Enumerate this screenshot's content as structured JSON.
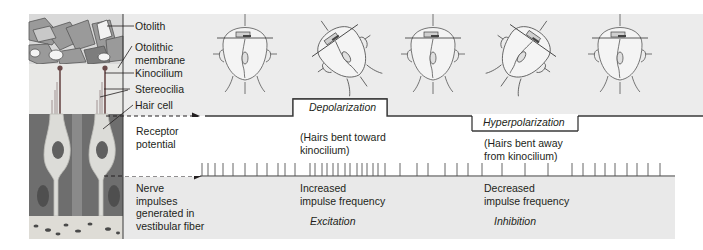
{
  "figure": {
    "colors": {
      "panel_bg": "#ececec",
      "line": "#3a3a3a",
      "tissue_dark": "#5a5a5a",
      "tissue_mid": "#8c8c8c",
      "cell_light": "#dcdcdc",
      "arrow": "#231f20"
    }
  },
  "anatomy_labels": {
    "otolith": "Otolith",
    "otolithic_membrane": "Otolithic\nmembrane",
    "kinocilium": "Kinocilium",
    "stereocilia": "Stereocilia",
    "hair_cell": "Hair cell"
  },
  "rows": {
    "receptor": {
      "label": "Receptor\npotential",
      "depolarization": "Depolarization",
      "depolarization_note": "(Hairs bent toward\nkinocilium)",
      "hyperpolarization": "Hyperpolarization",
      "hyperpolarization_note": "(Hairs bent away\nfrom kinocilium)"
    },
    "nerve": {
      "label": "Nerve\nimpulses\ngenerated in\nvestibular fiber",
      "increased": "Increased\nimpulse frequency",
      "excitation": "Excitation",
      "decreased": "Decreased\nimpulse frequency",
      "inhibition": "Inhibition"
    }
  },
  "heads": [
    {
      "id": "upright-1",
      "tilt_deg": 0
    },
    {
      "id": "tilt-forward",
      "tilt_deg": -35
    },
    {
      "id": "upright-2",
      "tilt_deg": 0
    },
    {
      "id": "tilt-backward",
      "tilt_deg": 35
    },
    {
      "id": "upright-3",
      "tilt_deg": 0
    }
  ],
  "chart_data": {
    "type": "line",
    "title": "",
    "series": [
      {
        "name": "Receptor potential",
        "x": [
          248,
          293,
          293,
          387,
          387,
          472,
          472,
          578,
          578,
          703
        ],
        "y": [
          "rest",
          "rest",
          "depolarized",
          "depolarized",
          "rest",
          "rest",
          "hyperpolarized",
          "hyperpolarized",
          "rest",
          "rest"
        ]
      },
      {
        "name": "Nerve impulses (spike x positions)",
        "x": [
          202,
          208,
          215,
          223,
          233,
          245,
          257,
          267,
          278,
          285,
          295,
          310,
          315,
          322,
          327,
          333,
          338,
          345,
          350,
          357,
          362,
          367,
          373,
          378,
          385,
          400,
          417,
          428,
          445,
          457,
          468,
          482,
          502,
          525,
          548,
          572,
          583,
          595,
          605,
          615,
          627,
          637,
          648,
          660
        ]
      }
    ],
    "annotations": [
      "Depolarization",
      "Hyperpolarization",
      "Excitation",
      "Inhibition"
    ]
  }
}
